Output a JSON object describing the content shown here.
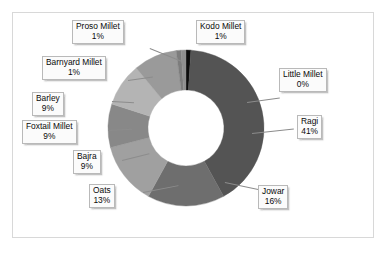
{
  "chart_data": {
    "type": "pie",
    "variant": "donut",
    "title": "",
    "xlabel": "",
    "ylabel": "",
    "legend_position": "none",
    "grid": false,
    "data_labels": "category name and percentage in callout boxes with leader lines",
    "start_angle_deg": 0,
    "direction": "clockwise",
    "categories": [
      "Kodo Millet",
      "Ragi",
      "Jowar",
      "Oats",
      "Bajra",
      "Foxtail Millet",
      "Barley",
      "Barnyard Millet",
      "Proso Millet",
      "Little Millet"
    ],
    "values": [
      1,
      41,
      16,
      13,
      9,
      9,
      9,
      1,
      1,
      0
    ],
    "value_unit": "%",
    "labels": [
      {
        "name": "Kodo Millet",
        "percent": "1%",
        "value": 1,
        "color": "#0d0d0d"
      },
      {
        "name": "Ragi",
        "percent": "41%",
        "value": 41,
        "color": "#545454"
      },
      {
        "name": "Jowar",
        "percent": "16%",
        "value": 16,
        "color": "#6e6e6e"
      },
      {
        "name": "Oats",
        "percent": "13%",
        "value": 13,
        "color": "#a0a0a0"
      },
      {
        "name": "Bajra",
        "percent": "9%",
        "value": 9,
        "color": "#888888"
      },
      {
        "name": "Foxtail Millet",
        "percent": "9%",
        "value": 9,
        "color": "#b4b4b4"
      },
      {
        "name": "Barley",
        "percent": "9%",
        "value": 9,
        "color": "#9a9a9a"
      },
      {
        "name": "Barnyard Millet",
        "percent": "1%",
        "value": 1,
        "color": "#7d7d7d"
      },
      {
        "name": "Proso Millet",
        "percent": "1%",
        "value": 1,
        "color": "#8f8f8f"
      },
      {
        "name": "Little Millet",
        "percent": "0%",
        "value": 0,
        "color": "#606060"
      }
    ]
  },
  "callouts": {
    "proso_millet": {
      "label": "Proso Millet",
      "value": "1%"
    },
    "kodo_millet": {
      "label": "Kodo Millet",
      "value": "1%"
    },
    "barnyard_millet": {
      "label": "Barnyard Millet",
      "value": "1%"
    },
    "little_millet": {
      "label": "Little Millet",
      "value": "0%"
    },
    "barley": {
      "label": "Barley",
      "value": "9%"
    },
    "ragi": {
      "label": "Ragi",
      "value": "41%"
    },
    "foxtail_millet": {
      "label": "Foxtail Millet",
      "value": "9%"
    },
    "bajra": {
      "label": "Bajra",
      "value": "9%"
    },
    "oats": {
      "label": "Oats",
      "value": "13%"
    },
    "jowar": {
      "label": "Jowar",
      "value": "16%"
    }
  },
  "colors": {
    "frame_border": "#d8d8d8",
    "callout_bg": "#fbfbfb",
    "callout_border": "#b9b9b9",
    "leader_line": "#8c8c8c",
    "text": "#0a0a0a",
    "background": "#ffffff"
  }
}
